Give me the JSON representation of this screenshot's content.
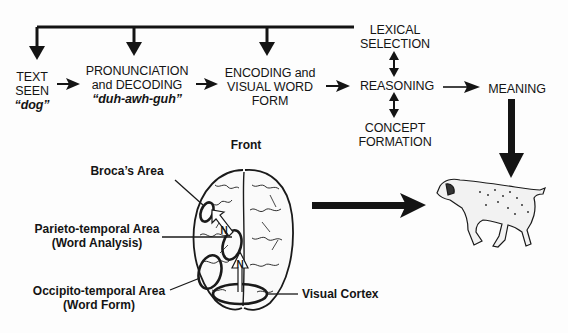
{
  "flow": {
    "text_seen": {
      "line1": "TEXT",
      "line2": "SEEN",
      "example": "“dog”"
    },
    "pronunciation": {
      "line1": "PRONUNCIATION",
      "line2": "and DECODING",
      "example": "“duh-awh-guh”"
    },
    "encoding": {
      "line1": "ENCODING and",
      "line2": "VISUAL WORD",
      "line3": "FORM"
    },
    "lexical": {
      "line1": "LEXICAL",
      "line2": "SELECTION"
    },
    "reasoning": {
      "label": "REASONING"
    },
    "concept": {
      "line1": "CONCEPT",
      "line2": "FORMATION"
    },
    "meaning": {
      "label": "MEANING"
    }
  },
  "brain": {
    "front_label": "Front",
    "brocas": "Broca’s Area",
    "parieto": {
      "line1": "Parieto-temporal Area",
      "line2": "(Word Analysis)"
    },
    "occipito": {
      "line1": "Occipito-temporal Area",
      "line2": "(Word Form)"
    },
    "visual_cortex": "Visual Cortex",
    "arrow_letters": [
      "N",
      "N"
    ]
  },
  "colors": {
    "ink": "#141414",
    "background": "#fdfdfd"
  }
}
